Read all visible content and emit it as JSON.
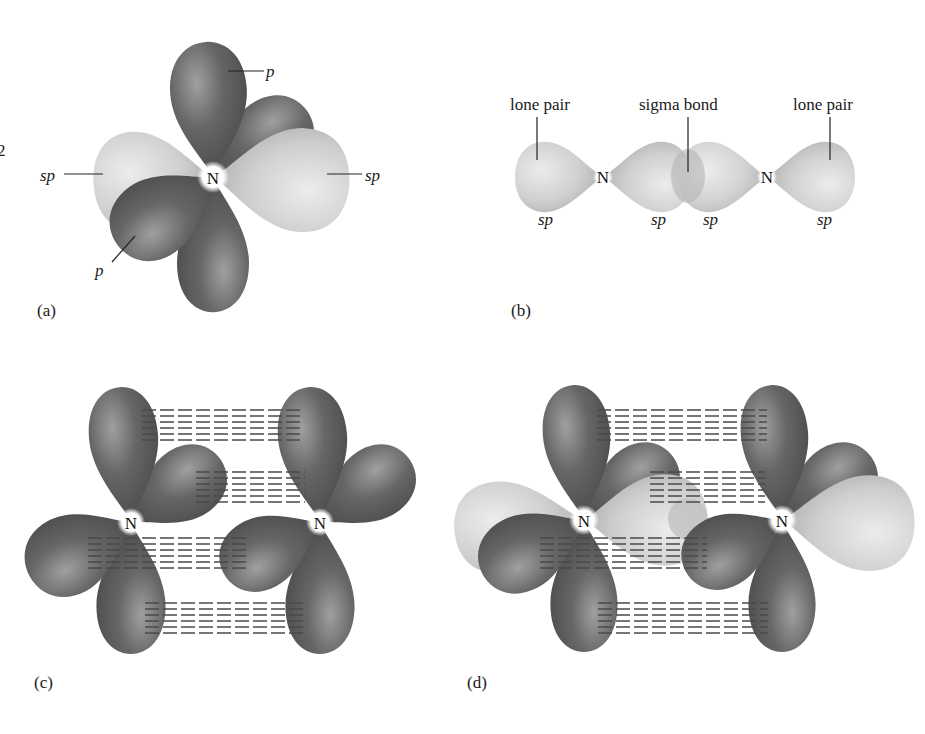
{
  "figure": {
    "stray_mark": "2",
    "panels": [
      {
        "id": "a",
        "caption": "(a)",
        "atom": "N",
        "labels": [
          {
            "text": "p",
            "points_to": "p-orbital-vertical"
          },
          {
            "text": "sp",
            "points_to": "sp-orbital-left"
          },
          {
            "text": "sp",
            "points_to": "sp-orbital-right"
          },
          {
            "text": "p",
            "points_to": "p-orbital-front"
          }
        ]
      },
      {
        "id": "b",
        "caption": "(b)",
        "atoms": [
          "N",
          "N"
        ],
        "top_labels": [
          "lone pair",
          "sigma bond",
          "lone pair"
        ],
        "orbital_labels": [
          "sp",
          "sp",
          "sp",
          "sp"
        ]
      },
      {
        "id": "c",
        "caption": "(c)",
        "atoms": [
          "N",
          "N"
        ]
      },
      {
        "id": "d",
        "caption": "(d)",
        "atoms": [
          "N",
          "N"
        ]
      }
    ]
  },
  "colors": {
    "p_orbital": "#5e5e5e",
    "p_orbital_highlight": "#9a9a9a",
    "sp_orbital": "#c8c8c8",
    "sp_orbital_highlight": "#e6e6e6",
    "nucleus_glow": "#ffffff",
    "text": "#1a1a1a"
  }
}
